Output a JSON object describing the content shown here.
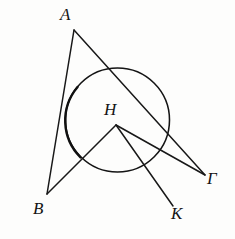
{
  "figure": {
    "kind": "euclidean-circle-diagram",
    "background_color": "#fdfdfc",
    "ink_color": "#141414",
    "width": 235,
    "height": 239,
    "circle": {
      "name": "main-circle",
      "center_x": 117.5,
      "center_y": 120,
      "radius": 52,
      "stroke_width": 1.55,
      "heavy_arc_note": "left arc drawn with heavier ink"
    },
    "points": [
      {
        "id": "A",
        "label": "A",
        "x": 74,
        "y": 30,
        "label_x": 60,
        "label_y": 6,
        "on_circle": true
      },
      {
        "id": "B",
        "label": "B",
        "x": 47,
        "y": 194,
        "label_x": 33,
        "label_y": 200,
        "on_circle": true
      },
      {
        "id": "G",
        "label": "Γ",
        "x": 205,
        "y": 175,
        "label_x": 207,
        "label_y": 170,
        "on_circle": true
      },
      {
        "id": "K",
        "label": "K",
        "x": 173,
        "y": 206,
        "label_x": 171,
        "label_y": 205,
        "on_circle": true
      },
      {
        "id": "H",
        "label": "H",
        "x": 116,
        "y": 125,
        "label_x": 104,
        "label_y": 101,
        "on_circle": false
      }
    ],
    "segments": [
      {
        "id": "AB",
        "from": "A",
        "to": "B",
        "x1": 74,
        "y1": 30,
        "x2": 47,
        "y2": 194
      },
      {
        "id": "AG",
        "from": "A",
        "to": "G",
        "x1": 74,
        "y1": 30,
        "x2": 205,
        "y2": 175
      },
      {
        "id": "HB",
        "from": "H",
        "to": "B",
        "x1": 116,
        "y1": 125,
        "x2": 47,
        "y2": 194
      },
      {
        "id": "HK",
        "from": "H",
        "to": "K",
        "x1": 116,
        "y1": 125,
        "x2": 173,
        "y2": 206
      },
      {
        "id": "HG",
        "from": "H",
        "to": "G",
        "x1": 116,
        "y1": 125,
        "x2": 205,
        "y2": 175
      }
    ]
  }
}
